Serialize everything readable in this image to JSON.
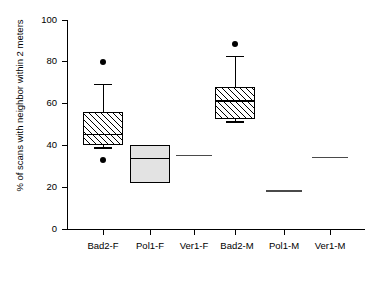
{
  "chart_data": {
    "type": "box",
    "title": "",
    "xlabel": "",
    "ylabel": "% of scans with neighbor within 2 meters",
    "ylim": [
      0,
      100
    ],
    "yticks": [
      0,
      20,
      40,
      60,
      80,
      100
    ],
    "ytick_labels": [
      "0",
      "20",
      "40",
      "60",
      "80",
      "100"
    ],
    "grid": false,
    "legend": "none",
    "categories": [
      "Bad2-F",
      "Pol1-F",
      "Ver1-F",
      "Bad2-M",
      "Pol1-M",
      "Ver1-M"
    ],
    "boxes": [
      {
        "name": "Bad2-F",
        "fill": "hatched",
        "q1": 40.0,
        "median": 45.5,
        "q3": 56.0,
        "whisker_low": 39.0,
        "whisker_high": 69.5,
        "outliers": [
          80.0,
          33.0
        ]
      },
      {
        "name": "Pol1-F",
        "fill": "solid",
        "q1": 22.0,
        "median": 34.0,
        "q3": 40.0,
        "whisker_low": 22.0,
        "whisker_high": 40.0,
        "outliers": []
      },
      {
        "name": "Ver1-F",
        "fill": "line",
        "q1": 35.5,
        "median": 35.5,
        "q3": 35.5,
        "whisker_low": 35.5,
        "whisker_high": 35.5,
        "outliers": []
      },
      {
        "name": "Bad2-M",
        "fill": "hatched",
        "q1": 52.5,
        "median": 61.5,
        "q3": 68.0,
        "whisker_low": 51.5,
        "whisker_high": 83.0,
        "outliers": [
          88.5
        ]
      },
      {
        "name": "Pol1-M",
        "fill": "line",
        "q1": 18.5,
        "median": 18.5,
        "q3": 18.5,
        "whisker_low": 18.5,
        "whisker_high": 18.5,
        "outliers": []
      },
      {
        "name": "Ver1-M",
        "fill": "line",
        "q1": 34.5,
        "median": 34.5,
        "q3": 34.5,
        "whisker_low": 34.5,
        "whisker_high": 34.5,
        "outliers": []
      }
    ]
  },
  "axis": {
    "y_title": "% of scans with neighbor within 2 meters",
    "y_labels": {
      "t0": "0",
      "t20": "20",
      "t40": "40",
      "t60": "60",
      "t80": "80",
      "t100": "100"
    },
    "x_labels": {
      "c0": "Bad2-F",
      "c1": "Pol1-F",
      "c2": "Ver1-F",
      "c3": "Bad2-M",
      "c4": "Pol1-M",
      "c5": "Ver1-M"
    }
  }
}
